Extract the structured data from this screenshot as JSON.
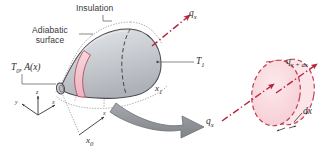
{
  "figure": {
    "background_color": "#ffffff"
  },
  "colors": {
    "solid_fill": "#c9ccd1",
    "solid_fill_light": "#dfe1e4",
    "solid_outline": "#4a4a4d",
    "band_pink": "#f2c3cc",
    "band_outline": "#b0505f",
    "disk_fill": "#f8d9de",
    "disk_outline": "#c0394f",
    "arrow_red": "#b5263c",
    "arrow_gray": "#8e9196",
    "leader_line": "#6b6b6e",
    "dotted_insulation": "#9a9a9d",
    "text": "#37373a"
  },
  "labels": {
    "insulation": "Insulation",
    "adiabatic_line1": "Adiabatic",
    "adiabatic_line2": "surface",
    "t0_area": "T₀, A(x)",
    "t1": "T₁",
    "x0": "x₀",
    "x1": "x₁",
    "qx_top": "qₓ",
    "qx_lower": "qₓ",
    "qx_dx": "qₓ₊ₜₓ",
    "dx": "dx"
  },
  "label_parts": {
    "t0": {
      "base": "T",
      "sub": "0",
      "rest": ", A(x)"
    },
    "t1": {
      "base": "T",
      "sub": "1"
    },
    "x0": {
      "base": "x",
      "sub": "0"
    },
    "x1": {
      "base": "x",
      "sub": "1"
    },
    "qx": {
      "base": "q",
      "sub": "x"
    },
    "qxdx": {
      "base": "q",
      "sub": "x + dx"
    },
    "dx": {
      "base": "dx"
    }
  },
  "axes": {
    "triad_left": {
      "x_label": "x",
      "y_label": "y",
      "z_label": "z",
      "origin": "lower-left"
    },
    "triad_x0": {
      "x_label": "x"
    }
  },
  "elements": {
    "solid_body": "tapered-cone-solid",
    "control_volume": "differential-slice-disk",
    "heat_in_arrow": "qx-in",
    "heat_out_arrow": "qx-plus-dx-out",
    "expand_arrow": "callout-expansion-arrow",
    "insulation_boundary": "dotted-insulation-envelope"
  }
}
